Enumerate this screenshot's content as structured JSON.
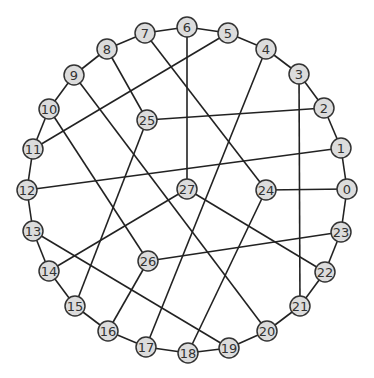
{
  "graph": {
    "node_radius": 10,
    "colors": {
      "node_fill": "#dcdcdc",
      "node_stroke": "#333333",
      "edge": "#222222",
      "label": "#333333"
    },
    "nodes": [
      {
        "id": "0",
        "x": 347,
        "y": 189
      },
      {
        "id": "1",
        "x": 341,
        "y": 148
      },
      {
        "id": "2",
        "x": 324,
        "y": 108
      },
      {
        "id": "3",
        "x": 299,
        "y": 74
      },
      {
        "id": "4",
        "x": 266,
        "y": 49
      },
      {
        "id": "5",
        "x": 228,
        "y": 33
      },
      {
        "id": "6",
        "x": 187,
        "y": 27
      },
      {
        "id": "7",
        "x": 145,
        "y": 33
      },
      {
        "id": "8",
        "x": 107,
        "y": 49
      },
      {
        "id": "9",
        "x": 74,
        "y": 75
      },
      {
        "id": "10",
        "x": 49,
        "y": 109
      },
      {
        "id": "11",
        "x": 33,
        "y": 149
      },
      {
        "id": "12",
        "x": 27,
        "y": 190
      },
      {
        "id": "13",
        "x": 33,
        "y": 231
      },
      {
        "id": "14",
        "x": 49,
        "y": 271
      },
      {
        "id": "15",
        "x": 75,
        "y": 306
      },
      {
        "id": "16",
        "x": 108,
        "y": 331
      },
      {
        "id": "17",
        "x": 146,
        "y": 347
      },
      {
        "id": "18",
        "x": 188,
        "y": 353
      },
      {
        "id": "19",
        "x": 229,
        "y": 348
      },
      {
        "id": "20",
        "x": 267,
        "y": 331
      },
      {
        "id": "21",
        "x": 300,
        "y": 306
      },
      {
        "id": "22",
        "x": 325,
        "y": 272
      },
      {
        "id": "23",
        "x": 341,
        "y": 232
      },
      {
        "id": "24",
        "x": 266,
        "y": 190
      },
      {
        "id": "25",
        "x": 147,
        "y": 120
      },
      {
        "id": "26",
        "x": 148,
        "y": 261
      },
      {
        "id": "27",
        "x": 187,
        "y": 189
      }
    ],
    "edges": [
      [
        "0",
        "1"
      ],
      [
        "1",
        "2"
      ],
      [
        "2",
        "3"
      ],
      [
        "3",
        "4"
      ],
      [
        "4",
        "5"
      ],
      [
        "5",
        "6"
      ],
      [
        "6",
        "7"
      ],
      [
        "7",
        "8"
      ],
      [
        "8",
        "9"
      ],
      [
        "9",
        "10"
      ],
      [
        "10",
        "11"
      ],
      [
        "11",
        "12"
      ],
      [
        "12",
        "13"
      ],
      [
        "13",
        "14"
      ],
      [
        "14",
        "15"
      ],
      [
        "15",
        "16"
      ],
      [
        "16",
        "17"
      ],
      [
        "17",
        "18"
      ],
      [
        "18",
        "19"
      ],
      [
        "19",
        "20"
      ],
      [
        "20",
        "21"
      ],
      [
        "21",
        "22"
      ],
      [
        "22",
        "23"
      ],
      [
        "23",
        "0"
      ],
      [
        "24",
        "0"
      ],
      [
        "24",
        "7"
      ],
      [
        "24",
        "18"
      ],
      [
        "3",
        "21"
      ],
      [
        "27",
        "6"
      ],
      [
        "27",
        "22"
      ],
      [
        "27",
        "14"
      ],
      [
        "25",
        "2"
      ],
      [
        "25",
        "8"
      ],
      [
        "25",
        "15"
      ],
      [
        "26",
        "23"
      ],
      [
        "26",
        "10"
      ],
      [
        "26",
        "16"
      ],
      [
        "1",
        "12"
      ],
      [
        "5",
        "11"
      ],
      [
        "4",
        "17"
      ],
      [
        "9",
        "20"
      ],
      [
        "13",
        "19"
      ]
    ]
  }
}
